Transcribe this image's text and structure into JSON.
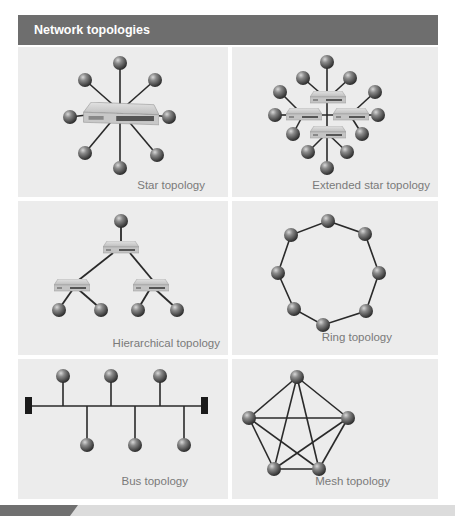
{
  "header": {
    "title": "Network topologies"
  },
  "colors": {
    "header_bg": "#6e6e6e",
    "panel_bg": "#ececec",
    "label": "#7a7a7a",
    "node": "#5a5a5a",
    "line": "#2a2a2a"
  },
  "panels": [
    {
      "id": "star",
      "label": "Star topology"
    },
    {
      "id": "extended-star",
      "label": "Extended star topology"
    },
    {
      "id": "hierarchical",
      "label": "Hierarchical topology"
    },
    {
      "id": "ring",
      "label": "Ring topology"
    },
    {
      "id": "bus",
      "label": "Bus topology"
    },
    {
      "id": "mesh",
      "label": "Mesh topology"
    }
  ],
  "icons": {
    "node": "node-sphere-icon",
    "switch": "network-switch-icon",
    "terminator": "bus-terminator-icon"
  }
}
